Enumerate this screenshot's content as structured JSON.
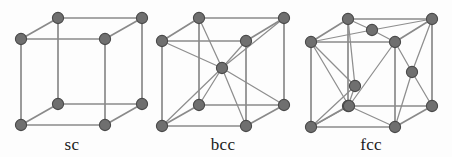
{
  "figure": {
    "background_color": "#fdfdfd",
    "width": 452,
    "height": 157,
    "atom_color": "#6f6f6f",
    "atom_stroke_color": "#4a4a4a",
    "edge_color": "#8e8e8e",
    "label_color": "#1b1b1b",
    "atom_radius": 5.6
  },
  "cells": [
    {
      "id": "sc",
      "label": "sc",
      "label_x": 72,
      "label_y": 150,
      "name": "simple-cubic",
      "atom_count": 8,
      "corner_atoms": [
        {
          "name": "front-top-left",
          "x": 21,
          "y": 39
        },
        {
          "name": "front-top-right",
          "x": 105,
          "y": 39
        },
        {
          "name": "front-bottom-left",
          "x": 21,
          "y": 125
        },
        {
          "name": "front-bottom-right",
          "x": 105,
          "y": 125
        },
        {
          "name": "back-top-left",
          "x": 58,
          "y": 18
        },
        {
          "name": "back-top-right",
          "x": 142,
          "y": 18
        },
        {
          "name": "back-bottom-left",
          "x": 58,
          "y": 104
        },
        {
          "name": "back-bottom-right",
          "x": 142,
          "y": 104
        }
      ],
      "interior_atoms": [],
      "edges": [
        [
          0,
          1
        ],
        [
          1,
          3
        ],
        [
          3,
          2
        ],
        [
          2,
          0
        ],
        [
          4,
          5
        ],
        [
          5,
          7
        ],
        [
          7,
          6
        ],
        [
          6,
          4
        ],
        [
          0,
          4
        ],
        [
          1,
          5
        ],
        [
          2,
          6
        ],
        [
          3,
          7
        ]
      ],
      "extra_edges": []
    },
    {
      "id": "bcc",
      "label": "bcc",
      "label_x": 223,
      "label_y": 150,
      "name": "body-centered-cubic",
      "atom_count": 9,
      "corner_atoms": [
        {
          "name": "front-top-left",
          "x": 162,
          "y": 41
        },
        {
          "name": "front-top-right",
          "x": 246,
          "y": 41
        },
        {
          "name": "front-bottom-left",
          "x": 162,
          "y": 126
        },
        {
          "name": "front-bottom-right",
          "x": 246,
          "y": 126
        },
        {
          "name": "back-top-left",
          "x": 199,
          "y": 18
        },
        {
          "name": "back-top-right",
          "x": 284,
          "y": 18
        },
        {
          "name": "back-bottom-left",
          "x": 199,
          "y": 105
        },
        {
          "name": "back-bottom-right",
          "x": 284,
          "y": 105
        }
      ],
      "interior_atoms": [
        {
          "name": "body-center",
          "x": 222,
          "y": 68
        }
      ],
      "edges": [
        [
          0,
          1
        ],
        [
          1,
          3
        ],
        [
          3,
          2
        ],
        [
          2,
          0
        ],
        [
          4,
          5
        ],
        [
          5,
          7
        ],
        [
          7,
          6
        ],
        [
          6,
          4
        ],
        [
          0,
          4
        ],
        [
          1,
          5
        ],
        [
          2,
          6
        ],
        [
          3,
          7
        ]
      ],
      "extra_edges": [
        [
          0,
          "c0"
        ],
        [
          1,
          "c0"
        ],
        [
          2,
          "c0"
        ],
        [
          3,
          "c0"
        ],
        [
          4,
          "c0"
        ],
        [
          5,
          "c0"
        ],
        [
          6,
          "c0"
        ],
        [
          7,
          "c0"
        ]
      ]
    },
    {
      "id": "fcc",
      "label": "fcc",
      "label_x": 371,
      "label_y": 150,
      "name": "face-centered-cubic",
      "atom_count": 12,
      "corner_atoms": [
        {
          "name": "front-top-left",
          "x": 311,
          "y": 42
        },
        {
          "name": "front-top-right",
          "x": 395,
          "y": 42
        },
        {
          "name": "front-bottom-left",
          "x": 311,
          "y": 127
        },
        {
          "name": "front-bottom-right",
          "x": 395,
          "y": 127
        },
        {
          "name": "back-top-left",
          "x": 348,
          "y": 19
        },
        {
          "name": "back-top-right",
          "x": 432,
          "y": 19
        },
        {
          "name": "back-bottom-left",
          "x": 348,
          "y": 106
        },
        {
          "name": "back-bottom-right",
          "x": 432,
          "y": 106
        }
      ],
      "interior_atoms": [
        {
          "name": "top-face-center",
          "x": 372,
          "y": 30
        },
        {
          "name": "left-face-center",
          "x": 355,
          "y": 86
        },
        {
          "name": "right-face-center",
          "x": 412,
          "y": 72
        },
        {
          "name": "front-face-center",
          "x": 349,
          "y": 106
        }
      ],
      "edges": [
        [
          0,
          1
        ],
        [
          1,
          3
        ],
        [
          3,
          2
        ],
        [
          2,
          0
        ],
        [
          4,
          5
        ],
        [
          5,
          7
        ],
        [
          7,
          6
        ],
        [
          6,
          4
        ],
        [
          0,
          4
        ],
        [
          1,
          5
        ],
        [
          2,
          6
        ],
        [
          3,
          7
        ]
      ],
      "extra_edges": [
        [
          4,
          "c0"
        ],
        [
          5,
          "c0"
        ],
        [
          0,
          "c0"
        ],
        [
          1,
          "c0"
        ],
        [
          0,
          "c1"
        ],
        [
          4,
          "c1"
        ],
        [
          2,
          "c1"
        ],
        [
          6,
          "c1"
        ],
        [
          1,
          "c2"
        ],
        [
          5,
          "c2"
        ],
        [
          3,
          "c2"
        ],
        [
          7,
          "c2"
        ],
        [
          0,
          "c3"
        ],
        [
          1,
          "c3"
        ],
        [
          2,
          "c3"
        ],
        [
          3,
          "c3"
        ]
      ]
    }
  ]
}
